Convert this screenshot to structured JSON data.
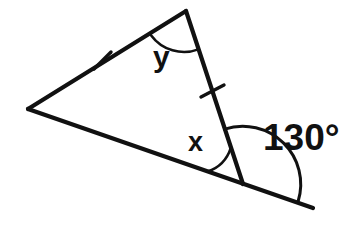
{
  "figure": {
    "background_color": "#ffffff",
    "stroke_color": "#111111",
    "width": 355,
    "height": 238,
    "vertices": {
      "left": {
        "name": "left-vertex",
        "x": 28,
        "y": 109
      },
      "top": {
        "name": "top-vertex",
        "x": 186,
        "y": 11
      },
      "bottom_right": {
        "name": "bottom-right-vertex",
        "x": 243,
        "y": 184
      },
      "ray_end": {
        "name": "extended-ray-end",
        "x": 313,
        "y": 208
      }
    },
    "segments": [
      {
        "name": "side-left-upper",
        "from": "left",
        "to": "top",
        "tick_marks": 1
      },
      {
        "name": "side-right",
        "from": "top",
        "to": "bottom_right",
        "tick_marks": 1
      },
      {
        "name": "side-base",
        "from": "left",
        "to": "bottom_right",
        "tick_marks": 0
      },
      {
        "name": "extended-ray",
        "from": "bottom_right",
        "to": "ray_end",
        "tick_marks": 0
      }
    ],
    "tick_marks": [
      {
        "name": "tick-left-upper-side",
        "x": 102,
        "y": 60
      },
      {
        "name": "tick-right-side",
        "x": 212,
        "y": 90
      }
    ],
    "angles": [
      {
        "name": "angle-y",
        "label": "y",
        "vertex": "top",
        "radius": 40,
        "known": false
      },
      {
        "name": "angle-x",
        "label": "x",
        "vertex": "bottom_right",
        "radius": 37,
        "known": false
      },
      {
        "name": "angle-130",
        "label": "130°",
        "value": 130,
        "vertex": "bottom_right",
        "radius": 58,
        "known": true
      }
    ]
  },
  "labels": {
    "y": "y",
    "x": "x",
    "exterior_angle": "130°"
  }
}
